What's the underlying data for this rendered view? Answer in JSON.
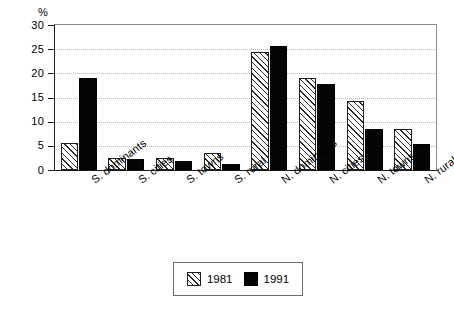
{
  "axis": {
    "unit_label": "%",
    "y_ticks": [
      "0",
      "5",
      "10",
      "15",
      "20",
      "25",
      "30"
    ]
  },
  "legend": {
    "entries": [
      {
        "label": "1981",
        "swatch": "hatched-diagonal-swatch"
      },
      {
        "label": "1991",
        "swatch": "solid-black-swatch"
      }
    ]
  },
  "chart_data": {
    "type": "bar",
    "title": "",
    "xlabel": "",
    "ylabel": "%",
    "ylim": [
      0,
      30
    ],
    "ytick_step": 5,
    "grid": true,
    "legend_position": "bottom-center",
    "categories": [
      "S. dominants",
      "S. cities",
      "S. towns",
      "S. rural",
      "N. dominants",
      "N. cities",
      "N. towns",
      "N. rural"
    ],
    "series": [
      {
        "name": "1981",
        "color": "#ffffff",
        "pattern": "diagonal-hatch",
        "values": [
          5.6,
          2.4,
          2.5,
          3.5,
          24.5,
          19.0,
          14.2,
          8.5
        ]
      },
      {
        "name": "1991",
        "color": "#050505",
        "pattern": "solid",
        "values": [
          19.0,
          2.3,
          1.8,
          1.3,
          25.7,
          17.8,
          8.5,
          5.3
        ]
      }
    ]
  }
}
